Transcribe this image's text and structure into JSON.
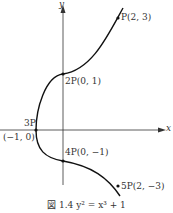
{
  "axes": {
    "x_label": "x",
    "y_label": "y"
  },
  "points": [
    {
      "label": "P(2, 3)",
      "x": 2,
      "y": 3
    },
    {
      "label": "2P(0, 1)",
      "x": 0,
      "y": 1
    },
    {
      "label": "3P",
      "coords": "(−1, 0)",
      "x": -1,
      "y": 0
    },
    {
      "label": "4P(0, −1)",
      "x": 0,
      "y": -1
    },
    {
      "label": "5P(2, −3)",
      "x": 2,
      "y": -3
    }
  ],
  "caption": "図 1.4  y² = x³ + 1",
  "curve_equation": "y^2 = x^3 + 1"
}
